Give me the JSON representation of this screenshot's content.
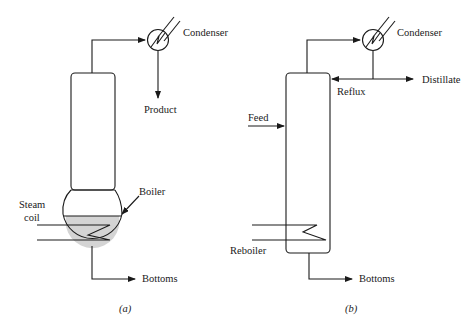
{
  "diagram": {
    "panel_a": {
      "caption": "(a)",
      "labels": {
        "condenser": "Condenser",
        "product": "Product",
        "boiler": "Boiler",
        "steam_coil_line1": "Steam",
        "steam_coil_line2": "coil",
        "bottoms": "Bottoms"
      }
    },
    "panel_b": {
      "caption": "(b)",
      "labels": {
        "condenser": "Condenser",
        "distillate": "Distillate",
        "reflux": "Reflux",
        "feed": "Feed",
        "reboiler": "Reboiler",
        "bottoms": "Bottoms"
      }
    },
    "colors": {
      "line": "#1a1a1a",
      "liquid_fill": "#d4d4d4"
    }
  }
}
